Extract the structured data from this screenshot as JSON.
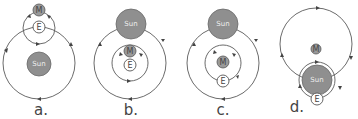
{
  "diagram": {
    "title_fragment": "",
    "options": [
      {
        "id": "a",
        "caption": "a.",
        "sun_label": "Sun",
        "moon_label": "M",
        "earth_label": "E"
      },
      {
        "id": "b",
        "caption": "b.",
        "sun_label": "Sun",
        "moon_label": "M",
        "earth_label": "E"
      },
      {
        "id": "c",
        "caption": "c.",
        "sun_label": "Sun",
        "moon_label": "M",
        "earth_label": "E"
      },
      {
        "id": "d",
        "caption": "d.",
        "sun_label": "Sun",
        "moon_label": "M",
        "earth_label": "E"
      }
    ],
    "colors": {
      "sun": "#8f8f8f",
      "moon": "#9a9a9a",
      "earth": "#ffffff",
      "orbit": "#5a5a5a"
    }
  }
}
